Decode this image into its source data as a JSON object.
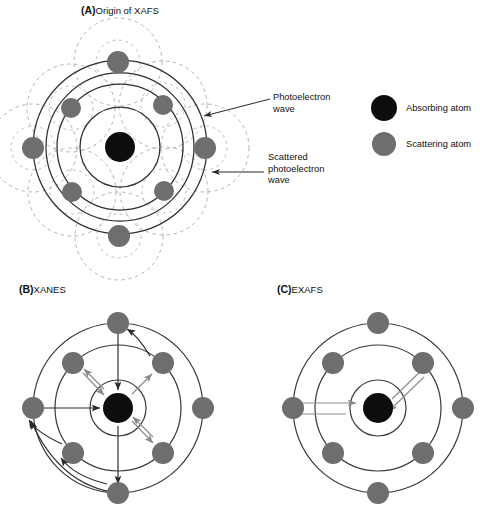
{
  "figure": {
    "width": 489,
    "height": 512,
    "background": "#ffffff",
    "colors": {
      "absorbing_atom": "#0d0d0d",
      "scattering_atom": "#6e6e6e",
      "solid_wave": "#2a2a2a",
      "dashed_wave": "#b0b0b0",
      "arrow_dark": "#2a2a2a",
      "arrow_gray": "#8a8a8a",
      "text": "#111111"
    }
  },
  "panels": [
    {
      "id": "A",
      "tag": "(A)",
      "title": "Origin of XAFS",
      "center": {
        "x": 120,
        "y": 147
      },
      "solid_circle_radii": [
        40,
        63,
        74,
        87
      ],
      "dashed_circle_radius": 44,
      "atoms": [
        {
          "name": "scattering-atom-top",
          "x": 118,
          "y": 62,
          "r": 11
        },
        {
          "name": "scattering-atom-upper-left",
          "x": 71,
          "y": 108,
          "r": 10
        },
        {
          "name": "scattering-atom-upper-right",
          "x": 163,
          "y": 105,
          "r": 10
        },
        {
          "name": "scattering-atom-left",
          "x": 33,
          "y": 148,
          "r": 11
        },
        {
          "name": "scattering-atom-right",
          "x": 205,
          "y": 148,
          "r": 11
        },
        {
          "name": "scattering-atom-lower-left",
          "x": 72,
          "y": 192,
          "r": 10
        },
        {
          "name": "scattering-atom-lower-right",
          "x": 164,
          "y": 191,
          "r": 10
        },
        {
          "name": "scattering-atom-bottom",
          "x": 119,
          "y": 236,
          "r": 11
        }
      ],
      "callouts": [
        {
          "name": "photoelectron-wave-callout",
          "text": "Photoelectron\nwave",
          "x": 273,
          "y": 92,
          "arrow": {
            "x1": 270,
            "x2": 204,
            "y1": 99,
            "y2": 115
          }
        },
        {
          "name": "scattered-wave-callout",
          "text": "Scattered\nphotoelectron\nwave",
          "x": 268,
          "y": 152,
          "arrow": {
            "x1": 264,
            "x2": 211,
            "y1": 172,
            "y2": 172
          }
        }
      ]
    },
    {
      "id": "B",
      "tag": "(B)",
      "title": "XANES",
      "center": {
        "x": 118,
        "y": 408
      },
      "circle_radii": [
        28,
        63,
        85
      ],
      "atoms": [
        {
          "name": "scattering-atom-top",
          "x": 118,
          "y": 323,
          "r": 11
        },
        {
          "name": "scattering-atom-upper-left",
          "x": 73,
          "y": 363,
          "r": 11
        },
        {
          "name": "scattering-atom-upper-right",
          "x": 163,
          "y": 363,
          "r": 11
        },
        {
          "name": "scattering-atom-left",
          "x": 33,
          "y": 408,
          "r": 11
        },
        {
          "name": "scattering-atom-right",
          "x": 203,
          "y": 408,
          "r": 11
        },
        {
          "name": "scattering-atom-lower-left",
          "x": 73,
          "y": 453,
          "r": 11
        },
        {
          "name": "scattering-atom-lower-right",
          "x": 163,
          "y": 453,
          "r": 11
        },
        {
          "name": "scattering-atom-bottom",
          "x": 118,
          "y": 493,
          "r": 11
        }
      ],
      "scattering_type": "multiple"
    },
    {
      "id": "C",
      "tag": "(C)",
      "title": "EXAFS",
      "center": {
        "x": 378,
        "y": 408
      },
      "circle_radii": [
        28,
        63,
        85
      ],
      "atoms": [
        {
          "name": "scattering-atom-top",
          "x": 378,
          "y": 323,
          "r": 11
        },
        {
          "name": "scattering-atom-upper-left",
          "x": 333,
          "y": 363,
          "r": 11
        },
        {
          "name": "scattering-atom-upper-right",
          "x": 423,
          "y": 363,
          "r": 11
        },
        {
          "name": "scattering-atom-left",
          "x": 293,
          "y": 408,
          "r": 11
        },
        {
          "name": "scattering-atom-right",
          "x": 463,
          "y": 408,
          "r": 11
        },
        {
          "name": "scattering-atom-lower-left",
          "x": 333,
          "y": 453,
          "r": 11
        },
        {
          "name": "scattering-atom-lower-right",
          "x": 423,
          "y": 453,
          "r": 11
        },
        {
          "name": "scattering-atom-bottom",
          "x": 378,
          "y": 493,
          "r": 11
        }
      ],
      "scattering_type": "single"
    }
  ],
  "legend": {
    "items": [
      {
        "name": "legend-absorbing-atom",
        "label": "Absorbing atom",
        "color": "#0d0d0d",
        "cx": 384,
        "cy": 108,
        "r": 13
      },
      {
        "name": "legend-scattering-atom",
        "label": "Scattering atom",
        "color": "#6e6e6e",
        "cx": 384,
        "cy": 144,
        "r": 12
      }
    ]
  }
}
